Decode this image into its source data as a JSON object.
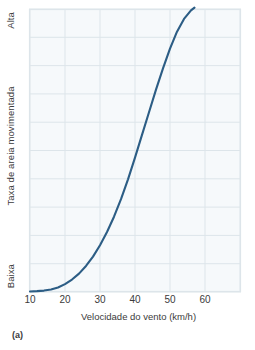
{
  "figure": {
    "caption": "(a)"
  },
  "chart_data": {
    "type": "line",
    "title": "",
    "subtitle": "",
    "xlabel": "Velocidade do vento (km/h)",
    "ylabel": "Taxa de areia movimentada",
    "y_top_label": "Alta",
    "y_bottom_label": "Baixa",
    "xlim": [
      10,
      70
    ],
    "ylim": [
      0,
      100
    ],
    "x_ticks": [
      10,
      20,
      30,
      40,
      50,
      60
    ],
    "x_tick_labels": [
      "10",
      "20",
      "30",
      "40",
      "50",
      "60"
    ],
    "y_ticks": [],
    "y_tick_labels": [],
    "grid": true,
    "grid_color": "#dde5ea",
    "plot_background": "#f6f9fb",
    "legend": null,
    "legend_position": "none",
    "series": [
      {
        "name": "Taxa de areia movimentada",
        "color": "#2c5d85",
        "line_width": 2.1,
        "x": [
          10,
          12,
          14,
          16,
          18,
          20,
          22,
          24,
          26,
          28,
          30,
          32,
          34,
          36,
          38,
          40,
          42,
          44,
          46,
          48,
          50,
          52,
          54,
          56,
          57
        ],
        "y": [
          0.2,
          0.3,
          0.5,
          0.9,
          1.6,
          2.8,
          4.4,
          6.5,
          9.2,
          12.5,
          16.5,
          21.2,
          26.6,
          32.8,
          39.8,
          47.5,
          55.5,
          63.5,
          71.5,
          79.0,
          86.0,
          92.0,
          96.5,
          99.5,
          100.5
        ]
      }
    ]
  }
}
